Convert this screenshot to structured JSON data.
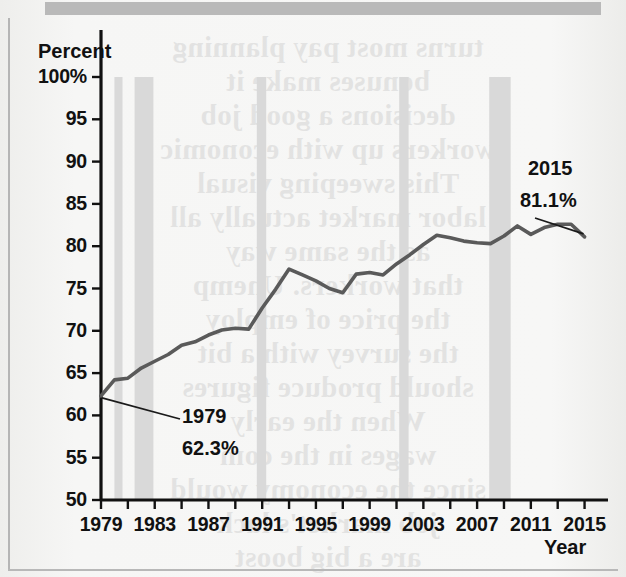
{
  "figure": {
    "y_axis_title": "Percent",
    "x_axis_title": "Year"
  },
  "annotations": {
    "start": {
      "year": "1979",
      "value": "62.3%"
    },
    "end": {
      "year": "2015",
      "value": "81.1%"
    }
  },
  "bleed_text": "turns most pay planning\nbonuses make it\ndecisions a good job\nworkers up with economic\nThis sweeping visual\nlabor market actually all\nas the same way\nthat workers. Unemp\nthe price of employ\nthe survey with a bit\nshould produce figures\nWhen the early\nwages in the com\nsince the economy would\njob market's lack\nare a big boost\nis measure MIT general",
  "colors": {
    "line": "#5a5a5a",
    "recession_band": "#d9d9d9",
    "axis": "#111111",
    "page": "#f4f4f3",
    "top_bar": "#b9b9b9"
  },
  "chart_data": {
    "type": "line",
    "title": "",
    "xlabel": "Year",
    "ylabel": "Percent",
    "xlim": [
      1979,
      2016
    ],
    "ylim": [
      50,
      100
    ],
    "grid": false,
    "legend": "none",
    "y_ticks": [
      50,
      55,
      60,
      65,
      70,
      75,
      80,
      85,
      90,
      95,
      100
    ],
    "y_tick_labels": [
      "50",
      "55",
      "60",
      "65",
      "70",
      "75",
      "80",
      "85",
      "90",
      "95",
      "100%"
    ],
    "x_ticks": [
      1979,
      1981,
      1983,
      1985,
      1987,
      1989,
      1991,
      1993,
      1995,
      1997,
      1999,
      2001,
      2003,
      2005,
      2007,
      2009,
      2011,
      2013,
      2015
    ],
    "x_tick_labels": [
      {
        "year": 1979,
        "label": "1979"
      },
      {
        "year": 1983,
        "label": "1983"
      },
      {
        "year": 1987,
        "label": "1987"
      },
      {
        "year": 1991,
        "label": "1991"
      },
      {
        "year": 1995,
        "label": "1995"
      },
      {
        "year": 1999,
        "label": "1999"
      },
      {
        "year": 2003,
        "label": "2003"
      },
      {
        "year": 2007,
        "label": "2007"
      },
      {
        "year": 2011,
        "label": "2011"
      },
      {
        "year": 2015,
        "label": "2015"
      }
    ],
    "recession_bands": [
      {
        "start": 1980.0,
        "end": 1980.6
      },
      {
        "start": 1981.5,
        "end": 1982.9
      },
      {
        "start": 1990.6,
        "end": 1991.3
      },
      {
        "start": 2001.2,
        "end": 2001.9
      },
      {
        "start": 2007.9,
        "end": 2009.5
      }
    ],
    "series": [
      {
        "name": "Percent",
        "x": [
          1979,
          1980,
          1981,
          1982,
          1983,
          1984,
          1985,
          1986,
          1987,
          1988,
          1989,
          1990,
          1991,
          1992,
          1993,
          1994,
          1995,
          1996,
          1997,
          1998,
          1999,
          2000,
          2001,
          2002,
          2003,
          2004,
          2005,
          2006,
          2007,
          2008,
          2009,
          2010,
          2011,
          2012,
          2013,
          2014,
          2015
        ],
        "values": [
          62.3,
          64.2,
          64.4,
          65.6,
          66.4,
          67.2,
          68.3,
          68.7,
          69.5,
          70.1,
          70.3,
          70.2,
          72.7,
          74.9,
          77.3,
          76.6,
          75.9,
          75.0,
          74.5,
          76.7,
          76.9,
          76.6,
          77.9,
          79.0,
          80.2,
          81.3,
          81.0,
          80.6,
          80.4,
          80.3,
          81.2,
          82.4,
          81.4,
          82.2,
          82.6,
          82.6,
          81.1
        ]
      }
    ]
  }
}
